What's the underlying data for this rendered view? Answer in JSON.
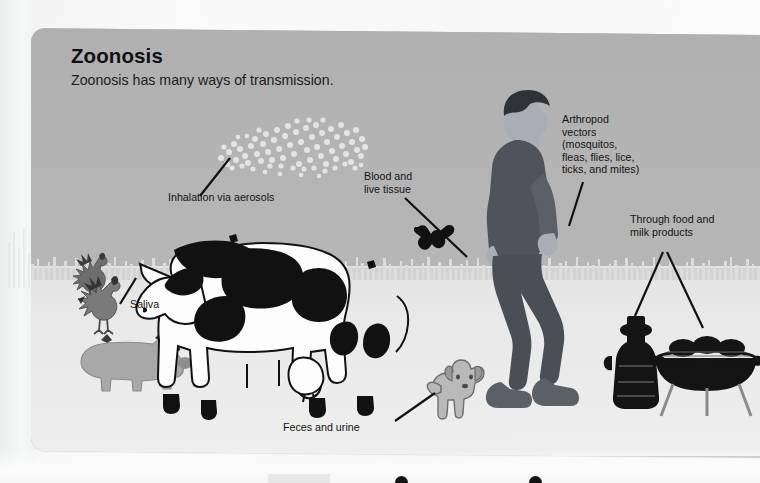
{
  "poster": {
    "title": "Zoonosis",
    "subtitle": "Zoonosis has many ways of transmission.",
    "panel_color": "#b3b3b3",
    "ground_color": "#e9e9e9",
    "text_color": "#141414"
  },
  "labels": {
    "aerosols": "Inhalation via aerosols",
    "blood": "Blood and\nlive tissue",
    "arthropod": "Arthropod\nvectors\n(mosquitos,\nfleas, flies, lice,\nticks, and mites)",
    "food": "Through food and\nmilk products",
    "saliva": "Saliva",
    "feces": "Feces and urine"
  },
  "figures": {
    "aerosol_cloud": "aerosol-droplet-cloud",
    "chicken_1": "rooster",
    "chicken_2": "rooster",
    "pig": "pig",
    "cow": "dairy-cow",
    "dog": "dog",
    "bat": "bat",
    "man": "walking-man",
    "milk_can": "milk-can",
    "grill": "bbq-grill"
  }
}
